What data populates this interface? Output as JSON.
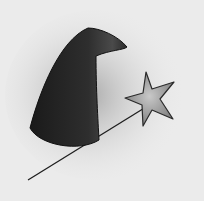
{
  "image": {
    "subject": "wizard hat and star wand",
    "elements": [
      {
        "name": "wizard-hat",
        "color": "#2a2a2a"
      },
      {
        "name": "star-wand",
        "color": "#9a9a9a"
      },
      {
        "name": "wand-stick",
        "color": "#1e1e1e"
      }
    ],
    "background": "#ebebeb"
  }
}
